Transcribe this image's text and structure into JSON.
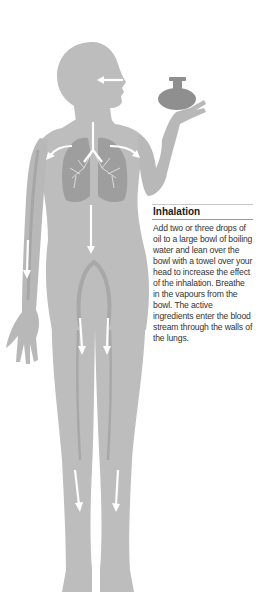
{
  "caption": {
    "heading": "Inhalation",
    "body": "Add two or three drops of oil to a large bowl of boiling water and lean over the bowl with a towel over your head to increase the effect of the inhalation. Breathe in the vapours from the bowl. The active ingredients enter the blood stream through the walls of the lungs."
  },
  "illustration": {
    "subject": "human-body-silhouette",
    "elements": [
      "oil-bottle",
      "nose-inhale-arrow",
      "lungs",
      "bloodstream-arrows"
    ],
    "colors": {
      "body": "#bdbdbd",
      "body_shadow": "#a9a9a9",
      "lungs": "#9e9e9e",
      "bottle": "#8f8f8f",
      "arrow": "#ffffff"
    }
  }
}
